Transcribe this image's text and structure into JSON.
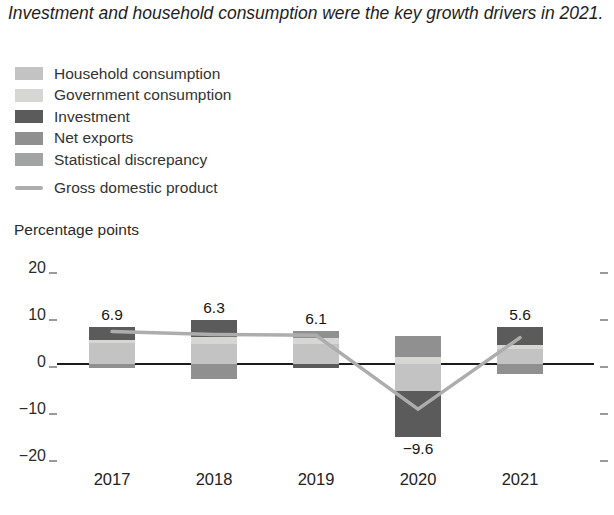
{
  "title": "Investment and household consumption were the key growth drivers in 2021.",
  "axis_label": "Percentage points",
  "legend": {
    "items": [
      {
        "label": "Household consumption",
        "color": "#c3c3c3",
        "type": "box"
      },
      {
        "label": "Government consumption",
        "color": "#d6d6d5",
        "type": "box"
      },
      {
        "label": "Investment",
        "color": "#5b5b5b",
        "type": "box"
      },
      {
        "label": "Net exports",
        "color": "#909091",
        "type": "box"
      },
      {
        "label": "Statistical discrepancy",
        "color": "#a2a3a3",
        "type": "box"
      },
      {
        "label": "Gross domestic product",
        "color": "#adadad",
        "type": "line"
      }
    ]
  },
  "chart_data": {
    "type": "bar",
    "subtype": "stacked-bar-with-line",
    "categories": [
      "2017",
      "2018",
      "2019",
      "2020",
      "2021"
    ],
    "series": [
      {
        "name": "Household consumption",
        "color": "#c3c3c3",
        "values": [
          4.4,
          4.2,
          4.2,
          -5.8,
          3.1
        ]
      },
      {
        "name": "Government consumption",
        "color": "#d6d6d5",
        "values": [
          0.7,
          1.5,
          1.3,
          1.5,
          0.9
        ]
      },
      {
        "name": "Investment",
        "color": "#5b5b5b",
        "values": [
          2.7,
          3.7,
          -0.9,
          -9.7,
          3.8
        ]
      },
      {
        "name": "Net exports",
        "color": "#909091",
        "values": [
          -0.9,
          -3.1,
          1.5,
          4.4,
          -2.2
        ]
      },
      {
        "name": "Statistical discrepancy",
        "color": "#a2a3a3",
        "values": [
          0,
          0,
          0,
          0,
          0
        ]
      }
    ],
    "line_series": {
      "name": "Gross domestic product",
      "color": "#adadad",
      "values": [
        6.9,
        6.3,
        6.1,
        -9.6,
        5.6
      ],
      "labels": [
        "6.9",
        "6.3",
        "6.1",
        "−9.6",
        "5.6"
      ]
    },
    "title": "Investment and household consumption were the key growth drivers in 2021.",
    "xlabel": "",
    "ylabel": "Percentage points",
    "ylim": [
      -20,
      20
    ],
    "yticks": {
      "values": [
        20,
        10,
        0,
        -10,
        -20
      ],
      "labels": [
        "20",
        "10",
        "0",
        "−10",
        "−20"
      ]
    },
    "grid": false,
    "legend_position": "top-left"
  }
}
